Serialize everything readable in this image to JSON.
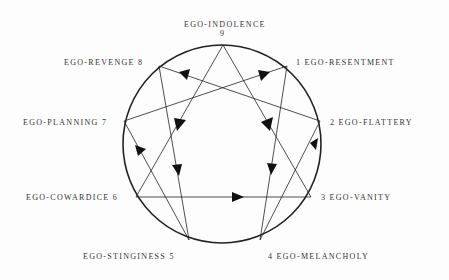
{
  "diagram": {
    "points": [
      {
        "num": "9",
        "label": "EGO-INDOLENCE"
      },
      {
        "num": "1",
        "label": "EGO-RESENTMENT"
      },
      {
        "num": "2",
        "label": "EGO-FLATTERY"
      },
      {
        "num": "3",
        "label": "EGO-VANITY"
      },
      {
        "num": "4",
        "label": "EGO-MELANCHOLY"
      },
      {
        "num": "5",
        "label": "EGO-STINGINESS"
      },
      {
        "num": "6",
        "label": "EGO-COWARDICE"
      },
      {
        "num": "7",
        "label": "EGO-PLANNING"
      },
      {
        "num": "8",
        "label": "EGO-REVENGE"
      }
    ],
    "label_texts": {
      "p9": "EGO-INDOLENCE",
      "p9num": "9",
      "p1": "1 EGO-RESENTMENT",
      "p2": "2 EGO-FLATTERY",
      "p3": "3 EGO-VANITY",
      "p4": "4 EGO-MELANCHOLY",
      "p5": "EGO-STINGINESS 5",
      "p6": "EGO-COWARDICE 6",
      "p7": "EGO-PLANNING 7",
      "p8": "EGO-REVENGE 8"
    },
    "connections": [
      [
        "9",
        "3"
      ],
      [
        "3",
        "6"
      ],
      [
        "6",
        "9"
      ],
      [
        "1",
        "4"
      ],
      [
        "4",
        "2"
      ],
      [
        "2",
        "8"
      ],
      [
        "8",
        "5"
      ],
      [
        "5",
        "7"
      ],
      [
        "7",
        "1"
      ]
    ],
    "colors": {
      "line": "#222222",
      "background": "#fdfdfd"
    }
  }
}
